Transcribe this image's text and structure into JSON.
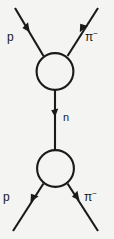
{
  "figure": {
    "width": 114,
    "height": 239,
    "background_color": "#f4f4f2",
    "line_color": "#1a1a1a"
  },
  "labels": {
    "top_left": {
      "name": "proton",
      "symbol": "p",
      "superscript": ""
    },
    "top_right": {
      "name": "pion-minus",
      "symbol": "π",
      "superscript": "−"
    },
    "middle": {
      "name": "neutron",
      "symbol": "n",
      "superscript": ""
    },
    "bottom_left": {
      "name": "proton",
      "symbol": "p",
      "superscript": ""
    },
    "bottom_right": {
      "name": "pion-minus",
      "symbol": "π",
      "superscript": "−"
    }
  },
  "vertices": [
    {
      "name": "upper-interaction-blob",
      "cx": 55,
      "cy": 71.5,
      "r": 18.5
    },
    {
      "name": "lower-interaction-blob",
      "cx": 55.5,
      "cy": 168.5,
      "r": 18.5
    }
  ],
  "lines": [
    {
      "name": "upper-left-proton-leg",
      "x1": 15,
      "y1": 8,
      "x2": 43,
      "y2": 56,
      "arrow": "up-left",
      "arrow_at": 0.42
    },
    {
      "name": "upper-right-pion-leg",
      "x1": 98,
      "y1": 8,
      "x2": 68,
      "y2": 56,
      "arrow": "up-right",
      "arrow_at": 0.42
    },
    {
      "name": "neutron-propagator",
      "x1": 55,
      "y1": 150,
      "x2": 55,
      "y2": 90,
      "arrow": "up",
      "arrow_at": 0.53
    },
    {
      "name": "lower-left-proton-leg",
      "x1": 13,
      "y1": 231,
      "x2": 43,
      "y2": 184,
      "arrow": "up-right",
      "arrow_at": 0.58
    },
    {
      "name": "lower-right-pion-leg",
      "x1": 98,
      "y1": 231,
      "x2": 68,
      "y2": 184,
      "arrow": "up-left",
      "arrow_at": 0.58
    }
  ]
}
